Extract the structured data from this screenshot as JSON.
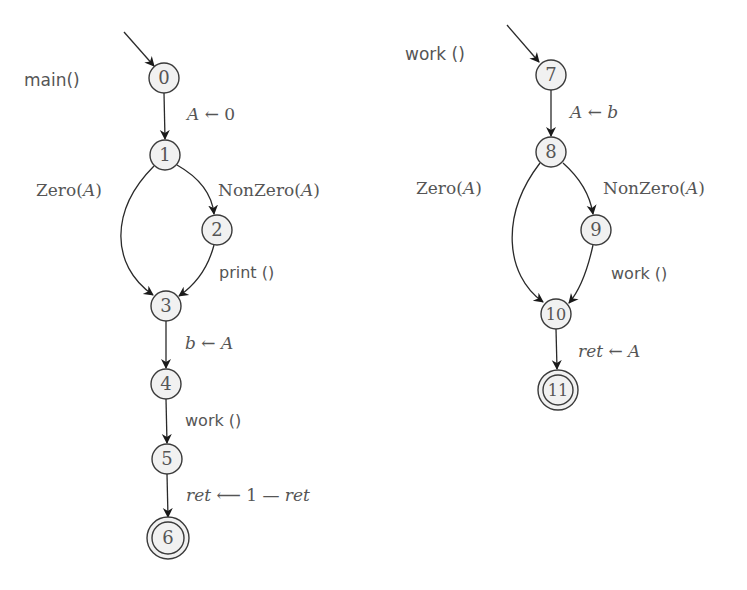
{
  "diagram": {
    "type": "control-flow-graph",
    "procedures": [
      {
        "name": "main()",
        "nodes": [
          {
            "id": "0",
            "x": 164,
            "y": 78,
            "final": false
          },
          {
            "id": "1",
            "x": 165,
            "y": 155,
            "final": false
          },
          {
            "id": "2",
            "x": 217,
            "y": 230,
            "final": false
          },
          {
            "id": "3",
            "x": 166,
            "y": 306,
            "final": false
          },
          {
            "id": "4",
            "x": 166,
            "y": 384,
            "final": false
          },
          {
            "id": "5",
            "x": 167,
            "y": 459,
            "final": false
          },
          {
            "id": "6",
            "x": 168,
            "y": 538,
            "final": true
          }
        ],
        "edges": [
          {
            "from": "0",
            "to": "1",
            "label": "A ← 0"
          },
          {
            "from": "1",
            "to": "3",
            "label": "Zero(A)"
          },
          {
            "from": "1",
            "to": "2",
            "label": "NonZero(A)"
          },
          {
            "from": "2",
            "to": "3",
            "label": "print ()"
          },
          {
            "from": "3",
            "to": "4",
            "label": "b ← A"
          },
          {
            "from": "4",
            "to": "5",
            "label": "work ()"
          },
          {
            "from": "5",
            "to": "6",
            "label": "ret ← 1 − ret"
          }
        ]
      },
      {
        "name": "work ()",
        "nodes": [
          {
            "id": "7",
            "x": 551,
            "y": 75,
            "final": false
          },
          {
            "id": "8",
            "x": 551,
            "y": 152,
            "final": false
          },
          {
            "id": "9",
            "x": 596,
            "y": 230,
            "final": false
          },
          {
            "id": "10",
            "x": 556,
            "y": 314,
            "final": false
          },
          {
            "id": "11",
            "x": 558,
            "y": 390,
            "final": true
          }
        ],
        "edges": [
          {
            "from": "7",
            "to": "8",
            "label": "A ← b"
          },
          {
            "from": "8",
            "to": "10",
            "label": "Zero(A)"
          },
          {
            "from": "8",
            "to": "9",
            "label": "NonZero(A)"
          },
          {
            "from": "9",
            "to": "10",
            "label": "work ()"
          },
          {
            "from": "10",
            "to": "11",
            "label": "ret ← A"
          }
        ]
      }
    ]
  },
  "labels": {
    "main_title": "main()",
    "work_title": "work ()",
    "n0": "0",
    "n1": "1",
    "n2": "2",
    "n3": "3",
    "n4": "4",
    "n5": "5",
    "n6": "6",
    "n7": "7",
    "n8": "8",
    "n9": "9",
    "n10": "10",
    "n11": "11",
    "e01_lhs": "A",
    "e01_op": " ← 0",
    "e13_zero": "Zero(",
    "e13_arg": "A",
    "e13_close": ")",
    "e12_nonzero": "NonZero(",
    "e12_arg": "A",
    "e12_close": ")",
    "e23": "print ()",
    "e34_lhs": "b",
    "e34_op": " ← ",
    "e34_rhs": "A",
    "e45": "work ()",
    "e56_ret1": "ret",
    "e56_op": " ⟵ 1 — ",
    "e56_ret2": "ret",
    "e78_lhs": "A",
    "e78_op": " ← ",
    "e78_rhs": "b",
    "e810_zero": "Zero(",
    "e810_arg": "A",
    "e810_close": ")",
    "e89_nonzero": "NonZero(",
    "e89_arg": "A",
    "e89_close": ")",
    "e910": "work ()",
    "e1011_ret": "ret",
    "e1011_op": " ← ",
    "e1011_rhs": "A"
  }
}
